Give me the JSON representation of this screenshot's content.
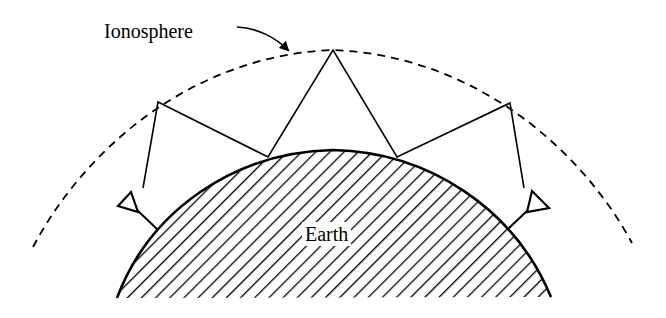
{
  "diagram": {
    "labels": {
      "ionosphere": "Ionosphere",
      "earth": "Earth"
    },
    "colors": {
      "stroke": "#000000",
      "background": "#ffffff"
    },
    "elements": {
      "ionosphere_layer": "dashed arc",
      "earth_surface": "hatched arc",
      "transmit_antenna": "left antenna",
      "receive_antenna": "right antenna",
      "ray_path": "multi-hop reflections between ionosphere and earth"
    },
    "hops": 3
  }
}
